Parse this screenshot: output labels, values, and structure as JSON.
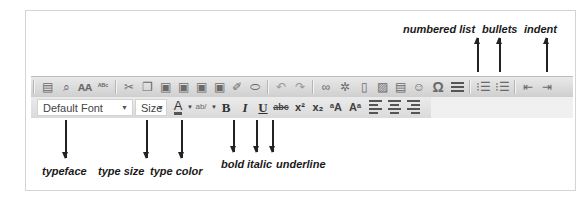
{
  "toolbar": {
    "row1": [
      {
        "name": "print-icon",
        "glyph": "🖶"
      },
      {
        "name": "preview-icon",
        "glyph": "🔍"
      },
      {
        "name": "find-icon",
        "glyph": "♊"
      },
      {
        "name": "spellcheck-icon",
        "glyph": "ABC"
      },
      {
        "name": "cut-icon",
        "glyph": "✂"
      },
      {
        "name": "copy-icon",
        "glyph": "❐"
      },
      {
        "name": "paste-icon",
        "glyph": "📋"
      },
      {
        "name": "paste-text-icon",
        "glyph": "📋"
      },
      {
        "name": "paste-word-icon",
        "glyph": "📋"
      },
      {
        "name": "paste-special-icon",
        "glyph": "📋"
      },
      {
        "name": "clean-format-icon",
        "glyph": "✎"
      },
      {
        "name": "eraser-icon",
        "glyph": "⌫"
      },
      {
        "name": "undo-icon",
        "glyph": "↶"
      },
      {
        "name": "redo-icon",
        "glyph": "↷"
      },
      {
        "name": "link-icon",
        "glyph": "∞"
      },
      {
        "name": "unlink-icon",
        "glyph": "✲"
      },
      {
        "name": "new-page-icon",
        "glyph": "▯"
      },
      {
        "name": "image-icon",
        "glyph": "▨"
      },
      {
        "name": "flash-icon",
        "glyph": "▤"
      },
      {
        "name": "smiley-icon",
        "glyph": "☺"
      },
      {
        "name": "special-char-icon",
        "glyph": "Ω"
      },
      {
        "name": "horizontal-rule-icon",
        "glyph": "☰"
      },
      {
        "name": "numbered-list-icon",
        "glyph": "☷"
      },
      {
        "name": "bulleted-list-icon",
        "glyph": "☷"
      },
      {
        "name": "outdent-icon",
        "glyph": "⇤"
      },
      {
        "name": "indent-icon",
        "glyph": "⇥"
      }
    ],
    "row2": {
      "font_select": "Default Font",
      "size_select": "Size",
      "text_color_glyph": "A",
      "highlight_glyph": "ab/",
      "bold": "B",
      "italic": "I",
      "underline": "U",
      "strike": "abc",
      "superscript": "x²",
      "subscript": "x₂",
      "shrink_font": "ᵃA",
      "grow_font": "Aᵃ"
    }
  },
  "annotations": {
    "top": {
      "numbered_list": "numbered list",
      "bullets": "bullets",
      "indent": "indent"
    },
    "bottom": {
      "typeface": "typeface",
      "type_size": "type size",
      "type_color": "type color",
      "bold": "bold",
      "italic": "italic",
      "underline": "underline"
    }
  }
}
